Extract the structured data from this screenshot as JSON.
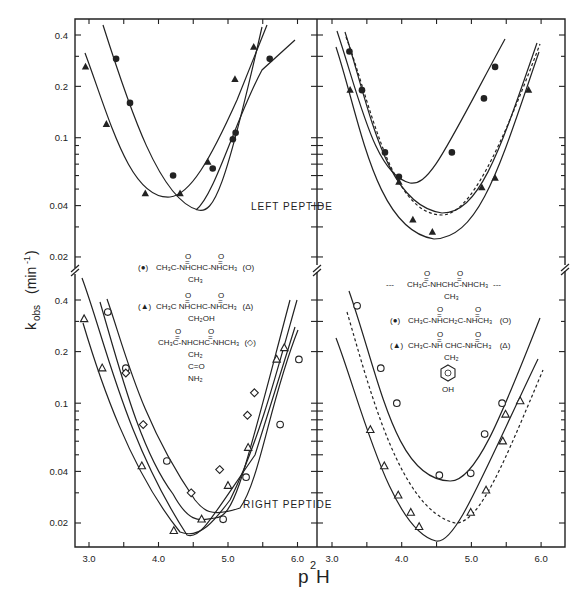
{
  "chart_data": [
    {
      "type": "scatter",
      "panel": "top-left",
      "title": "",
      "xlabel": "p²H",
      "ylabel": "k_obs (min⁻¹)",
      "yscale": "log",
      "xlim": [
        2.8,
        6.3
      ],
      "ylim": [
        0.017,
        0.46
      ],
      "annotation": "LEFT PEPTIDE",
      "series": [
        {
          "name": "CH3C(O)-NHCH(CH3)C(O)-NHCH3 (●)",
          "marker": "filled-circle",
          "x": [
            3.39,
            3.59,
            4.21,
            4.78,
            5.07,
            5.11,
            5.6
          ],
          "y": [
            0.29,
            0.16,
            0.06,
            0.066,
            0.098,
            0.107,
            0.29
          ]
        },
        {
          "name": "CH3C(O)-NHCH(CH2OH)C(O)-NHCH3 (▲)",
          "marker": "filled-triangle",
          "x": [
            2.95,
            3.25,
            3.81,
            4.31,
            4.71,
            5.1,
            5.37
          ],
          "y": [
            0.26,
            0.12,
            0.047,
            0.047,
            0.072,
            0.22,
            0.34
          ]
        }
      ],
      "curves": [
        {
          "name": "● fit",
          "minimum": {
            "x": 4.6,
            "y": 0.038
          }
        },
        {
          "name": "▲ fit",
          "minimum": {
            "x": 4.15,
            "y": 0.042
          }
        }
      ]
    },
    {
      "type": "scatter",
      "panel": "top-right",
      "yscale": "log",
      "xlim": [
        2.8,
        6.3
      ],
      "ylim": [
        0.017,
        0.46
      ],
      "series": [
        {
          "name": "CH3C(O)-NHCH2C(O)-NHCH3 (●)",
          "marker": "filled-circle",
          "x": [
            3.25,
            3.43,
            3.76,
            3.96,
            4.72,
            5.18,
            5.34
          ],
          "y": [
            0.32,
            0.19,
            0.082,
            0.059,
            0.082,
            0.17,
            0.26
          ]
        },
        {
          "name": "CH3C(O)-NHCH(CH2-C6H4OH)C(O)-NHCH3 (▲)",
          "marker": "filled-triangle",
          "x": [
            3.26,
            3.96,
            4.16,
            4.44,
            5.15,
            5.34,
            5.82
          ],
          "y": [
            0.19,
            0.055,
            0.033,
            0.028,
            0.051,
            0.058,
            0.19
          ]
        }
      ],
      "curves": [
        {
          "name": "● fit",
          "minimum": {
            "x": 4.45,
            "y": 0.048
          }
        },
        {
          "name": "▲ fit",
          "minimum": {
            "x": 4.6,
            "y": 0.026
          }
        },
        {
          "name": "Ala reference (dashed)",
          "style": "dashed",
          "minimum": {
            "x": 4.7,
            "y": 0.033
          }
        }
      ]
    },
    {
      "type": "scatter",
      "panel": "bottom-left",
      "yscale": "log",
      "xlim": [
        2.8,
        6.3
      ],
      "ylim": [
        0.015,
        0.46
      ],
      "xticks": [
        "3.0",
        "4.0",
        "5.0",
        "6.0"
      ],
      "yticks": [
        "0.02",
        "0.04",
        "0.1",
        "0.2",
        "0.4"
      ],
      "series": [
        {
          "name": "CH3C(O)-NHCH(CH3)C(O)-NHCH3 (○)",
          "marker": "open-circle",
          "x": [
            3.27,
            3.53,
            4.12,
            4.93,
            5.26,
            5.75,
            6.02
          ],
          "y": [
            0.34,
            0.16,
            0.046,
            0.021,
            0.037,
            0.075,
            0.18
          ]
        },
        {
          "name": "CH3C(O)-NHCH(CH2OH)C(O)-NHCH3 (△)",
          "marker": "open-triangle",
          "x": [
            2.93,
            3.19,
            3.76,
            4.22,
            4.62,
            5.0,
            5.29,
            5.7,
            5.81
          ],
          "y": [
            0.31,
            0.16,
            0.043,
            0.018,
            0.021,
            0.033,
            0.055,
            0.18,
            0.21
          ]
        },
        {
          "name": "CH3C(O)-NHCH(CH2C(O)NH2)C(O)-NHCH3 (◇)",
          "marker": "open-diamond",
          "x": [
            3.53,
            3.78,
            4.47,
            4.88,
            5.28,
            5.38
          ],
          "y": [
            0.15,
            0.075,
            0.03,
            0.041,
            0.085,
            0.115
          ]
        }
      ],
      "annotation": "RIGHT PEPTIDE"
    },
    {
      "type": "scatter",
      "panel": "bottom-right",
      "yscale": "log",
      "xlim": [
        2.8,
        6.3
      ],
      "ylim": [
        0.015,
        0.46
      ],
      "xticks": [
        "3.0",
        "4.0",
        "5.0",
        "6.0"
      ],
      "series": [
        {
          "name": "CH3C(O)-NHCH2C(O)-NHCH3 (○)",
          "marker": "open-circle",
          "x": [
            3.36,
            3.7,
            3.93,
            4.54,
            4.99,
            5.19,
            5.44
          ],
          "y": [
            0.37,
            0.16,
            0.1,
            0.038,
            0.039,
            0.066,
            0.1
          ]
        },
        {
          "name": "CH3C(O)-NHCH(CH2-C6H4OH)C(O)-NHCH3 (△)",
          "marker": "open-triangle",
          "x": [
            3.55,
            3.75,
            3.95,
            4.13,
            4.25,
            4.99,
            5.21,
            5.45,
            5.49,
            5.7
          ],
          "y": [
            0.07,
            0.043,
            0.029,
            0.023,
            0.019,
            0.023,
            0.031,
            0.06,
            0.086,
            0.103
          ]
        }
      ],
      "curves": [
        {
          "name": "Ala reference (dashed)",
          "style": "dashed",
          "minimum": {
            "x": 4.85,
            "y": 0.02
          }
        }
      ]
    }
  ],
  "labels": {
    "xlabel_base": "p",
    "xlabel_sup": "2",
    "xlabel_end": "H",
    "ylabel_k": "k",
    "ylabel_sub": "obs",
    "ylabel_unit": "(min",
    "ylabel_sup": "-1",
    "ylabel_close": ")",
    "left_peptide": "LEFT PEPTIDE",
    "right_peptide": "RIGHT PEPTIDE",
    "yticks_top": [
      "0.4",
      "0.2",
      "0.1",
      "0.04",
      "0.02"
    ],
    "yticks_bottom": [
      "0.4",
      "0.2",
      "0.1",
      "0.04",
      "0.02"
    ],
    "xticks_left": [
      "3.0",
      "4.0",
      "5.0",
      "6.0"
    ],
    "xticks_right": [
      "3.0",
      "4.0",
      "5.0",
      "6.0"
    ]
  },
  "legend_left": {
    "row1": {
      "marker": "(●)",
      "formula": "CH₃C-NHCHC-NHCH₃",
      "side": "CH₃",
      "open": "(O)"
    },
    "row2": {
      "marker": "(▲)",
      "formula": "CH₃C NHCHC-NHCH₃",
      "side": "CH₂OH",
      "open": "(Δ)"
    },
    "row3": {
      "formula": "CH₃C-NHCHC-NHCH₃",
      "side1": "CH₂",
      "side2": "C=O",
      "side3": "NH₂",
      "open": "(◇)"
    }
  },
  "legend_right": {
    "row1": {
      "prefix": "---",
      "formula": "CH₃C-NHCHC-NHCH₃",
      "side": "CH₃",
      "suffix": "---"
    },
    "row2": {
      "marker": "(●)",
      "formula": "CH₃C-NHCH₂C-NHCH₃",
      "open": "(O)"
    },
    "row3": {
      "marker": "(▲)",
      "formula": "CH₃C-NH CHC-NHCH₃",
      "side1": "CH₂",
      "side2": "OH",
      "open": "(Δ)"
    }
  },
  "carbonyl_o": "O"
}
